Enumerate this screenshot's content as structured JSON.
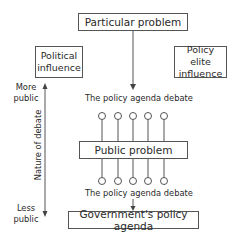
{
  "diagram": {
    "top_box": "Particular problem",
    "left_box": {
      "line1": "Political",
      "line2": "influence"
    },
    "right_box": {
      "line1": "Policy elite",
      "line2": "influence"
    },
    "debate_label_top": "The policy agenda debate",
    "center_box": "Public problem",
    "debate_label_bottom": "The policy agenda debate",
    "bottom_box": "Government's policy agenda",
    "axis": {
      "top_label": {
        "line1": "More",
        "line2": "public"
      },
      "bottom_label": {
        "line1": "Less",
        "line2": "public"
      },
      "axis_title": "Nature of debate"
    },
    "connector_count": 5,
    "colors": {
      "line": "#555555",
      "text": "#2a2a2a",
      "background": "#ffffff"
    }
  }
}
